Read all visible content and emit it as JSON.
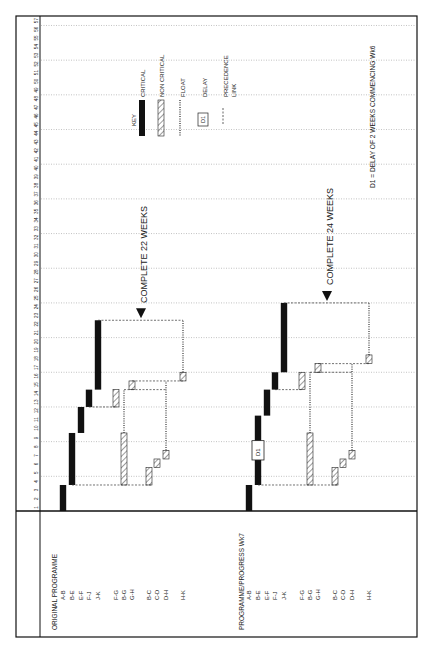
{
  "title_labels": {
    "original": "ORIGINAL  PROGRAMME",
    "progress": "PROGRAMME/PROGRESS  Wk7"
  },
  "axis": {
    "label_weeks_min": 1,
    "label_weeks_max": 57,
    "gridline_every_weeks": 4
  },
  "key": {
    "title": "KEY",
    "items": [
      {
        "type": "critical",
        "label": "CRITICAL"
      },
      {
        "type": "non-critical",
        "label": "NON  CRITICAL"
      },
      {
        "type": "float",
        "label": "FLOAT"
      },
      {
        "type": "delay",
        "label": "DELAY",
        "box_text": "D1"
      },
      {
        "type": "precedence",
        "label": "PRECEDENCE\nLINK"
      }
    ]
  },
  "footnote": "D1  =  DELAY  OF  2  WEEKS  COMMENCING  Wk6",
  "chart_data": {
    "type": "gantt",
    "orientation": "rotated-90",
    "units": "weeks",
    "programmes": [
      {
        "name": "ORIGINAL  PROGRAMME",
        "completion_label": "COMPLETE  22  WEEKS",
        "completion_week": 22,
        "activities": [
          {
            "id": "A-B",
            "start": 0,
            "end": 3,
            "kind": "critical"
          },
          {
            "id": "B-E",
            "start": 3,
            "end": 9,
            "kind": "critical"
          },
          {
            "id": "E-F",
            "start": 9,
            "end": 12,
            "kind": "critical"
          },
          {
            "id": "F-J",
            "start": 12,
            "end": 14,
            "kind": "critical"
          },
          {
            "id": "J-K",
            "start": 14,
            "end": 22,
            "kind": "critical"
          },
          {
            "id": "F-G",
            "start": 12,
            "end": 14,
            "kind": "non-critical"
          },
          {
            "id": "B-G",
            "start": 3,
            "end": 9,
            "kind": "non-critical",
            "float_to": 14
          },
          {
            "id": "G-H",
            "start": 14,
            "end": 15,
            "kind": "non-critical"
          },
          {
            "id": "B-C",
            "start": 3,
            "end": 5,
            "kind": "non-critical"
          },
          {
            "id": "C-D",
            "start": 5,
            "end": 6,
            "kind": "non-critical"
          },
          {
            "id": "D-H",
            "start": 6,
            "end": 7,
            "kind": "non-critical",
            "float_to": 15
          },
          {
            "id": "H-K",
            "start": 15,
            "end": 16,
            "kind": "non-critical",
            "float_to": 22
          }
        ]
      },
      {
        "name": "PROGRAMME/PROGRESS  Wk7",
        "completion_label": "COMPLETE  24  WEEKS",
        "completion_week": 24,
        "delay": {
          "label": "D1",
          "activity": "B-E",
          "start": 6,
          "end": 8
        },
        "activities": [
          {
            "id": "A-B",
            "start": 0,
            "end": 3,
            "kind": "critical"
          },
          {
            "id": "B-E",
            "start": 3,
            "end": 11,
            "kind": "critical"
          },
          {
            "id": "E-F",
            "start": 11,
            "end": 14,
            "kind": "critical"
          },
          {
            "id": "F-J",
            "start": 14,
            "end": 16,
            "kind": "critical"
          },
          {
            "id": "J-K",
            "start": 16,
            "end": 24,
            "kind": "critical"
          },
          {
            "id": "F-G",
            "start": 14,
            "end": 16,
            "kind": "non-critical"
          },
          {
            "id": "B-G",
            "start": 3,
            "end": 9,
            "kind": "non-critical",
            "float_to": 16
          },
          {
            "id": "G-H",
            "start": 16,
            "end": 17,
            "kind": "non-critical"
          },
          {
            "id": "B-C",
            "start": 3,
            "end": 5,
            "kind": "non-critical"
          },
          {
            "id": "C-D",
            "start": 5,
            "end": 6,
            "kind": "non-critical"
          },
          {
            "id": "D-H",
            "start": 6,
            "end": 7,
            "kind": "non-critical",
            "float_to": 17
          },
          {
            "id": "H-K",
            "start": 17,
            "end": 18,
            "kind": "non-critical",
            "float_to": 24
          }
        ]
      }
    ]
  }
}
